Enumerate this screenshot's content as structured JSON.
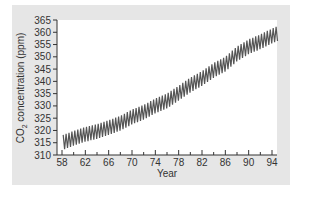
{
  "chart_data": {
    "type": "line",
    "title": "",
    "xlabel": "Year",
    "ylabel": "CO2 concentration (ppm)",
    "ylabel_parts": {
      "pre": "CO",
      "sub": "2",
      "post": " concentration (ppm)"
    },
    "xlim": [
      57,
      95.5
    ],
    "ylim": [
      310,
      365
    ],
    "x_ticks": [
      58,
      62,
      66,
      70,
      74,
      78,
      82,
      86,
      90,
      94
    ],
    "x_minor_ticks": [
      60,
      64,
      68,
      72,
      76,
      80,
      84,
      88,
      92
    ],
    "y_ticks": [
      310,
      315,
      320,
      325,
      330,
      335,
      340,
      345,
      350,
      355,
      360,
      365
    ],
    "grid": false,
    "legend": null,
    "line_color": "#555555",
    "series": [
      {
        "name": "Monthly CO2 (Mauna Loa)",
        "description": "Seasonal sawtooth oscillation superimposed on rising trend",
        "annual_trend": {
          "x": [
            58,
            60,
            62,
            64,
            66,
            68,
            70,
            72,
            74,
            76,
            78,
            80,
            82,
            84,
            86,
            88,
            90,
            92,
            94,
            95
          ],
          "mean": [
            315.0,
            316.8,
            318.4,
            319.6,
            321.2,
            322.9,
            325.5,
            327.4,
            330.0,
            332.0,
            335.2,
            338.5,
            341.2,
            344.5,
            347.0,
            351.2,
            354.1,
            356.1,
            358.5,
            359.5
          ]
        },
        "seasonal_amplitude": 3.0
      }
    ]
  }
}
